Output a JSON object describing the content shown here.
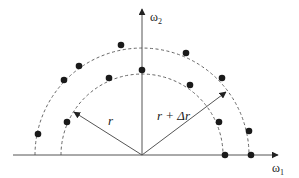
{
  "diagram": {
    "type": "polar-sampling-diagram",
    "axes": {
      "x_label": "ω",
      "x_sub": "1",
      "y_label": "ω",
      "y_sub": "2"
    },
    "vectors": [
      {
        "label": "r",
        "target": "inner-circle"
      },
      {
        "label": "r + Δr",
        "target": "outer-circle"
      }
    ],
    "circles": [
      {
        "name": "inner",
        "style": "dashed",
        "radius_label": "r"
      },
      {
        "name": "outer",
        "style": "dashed",
        "radius_label": "r + Δr"
      }
    ],
    "colors": {
      "line": "#555555",
      "dot": "#1a1a1a",
      "background": "#ffffff"
    }
  }
}
